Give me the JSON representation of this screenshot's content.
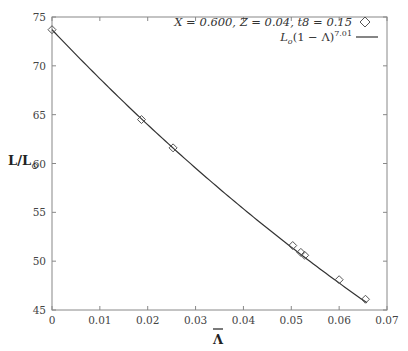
{
  "chart_data": {
    "type": "line",
    "title": "",
    "xlabel": "Λ̄",
    "ylabel": "L/L☉",
    "xlim": [
      0,
      0.07
    ],
    "ylim": [
      45,
      75
    ],
    "xticks": [
      "0",
      "0.01",
      "0.02",
      "0.03",
      "0.04",
      "0.05",
      "0.06",
      "0.07"
    ],
    "yticks": [
      "45",
      "50",
      "55",
      "60",
      "65",
      "70",
      "75"
    ],
    "grid": false,
    "legend_position": "top-right",
    "series": [
      {
        "name": "X = 0.600, Z = 0.04, t8 = 0.15",
        "style": "markers",
        "marker": "diamond",
        "x": [
          0.0,
          0.0187,
          0.0253,
          0.0503,
          0.052,
          0.0528,
          0.06,
          0.0655
        ],
        "y": [
          73.7,
          64.5,
          61.6,
          51.6,
          50.9,
          50.6,
          48.1,
          46.1
        ]
      },
      {
        "name": "L0(1 − Λ)^7.01",
        "style": "line",
        "formula": "L0*(1-Lambda)^7.01",
        "L0": 73.7,
        "exponent": 7.01
      }
    ]
  },
  "legend": {
    "entry1": "X = 0.600, Z = 0.04, t8 = 0.15",
    "entry2_base": "L",
    "entry2_sub": "o",
    "entry2_mid": "(1 − Λ)",
    "entry2_sup": "7.01"
  },
  "axes": {
    "ylabel_main": "L/L",
    "ylabel_sub": "⊙",
    "xlabel": "Λ"
  },
  "colors": {
    "axis": "#888888",
    "line": "#333333",
    "marker": "#555555"
  }
}
